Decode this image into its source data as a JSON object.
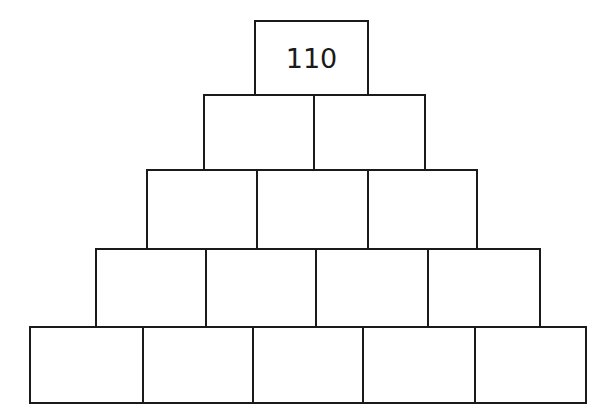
{
  "rows": [
    {
      "cells": [
        {
          "value": "110",
          "x": 254,
          "y": 20,
          "w": 115,
          "h": 76
        }
      ]
    },
    {
      "cells": [
        {
          "value": "",
          "x": 203,
          "y": 94,
          "w": 112,
          "h": 77
        },
        {
          "value": "",
          "x": 313,
          "y": 94,
          "w": 113,
          "h": 77
        }
      ]
    },
    {
      "cells": [
        {
          "value": "",
          "x": 146,
          "y": 169,
          "w": 112,
          "h": 81
        },
        {
          "value": "",
          "x": 256,
          "y": 169,
          "w": 113,
          "h": 81
        },
        {
          "value": "",
          "x": 367,
          "y": 169,
          "w": 111,
          "h": 81
        }
      ]
    },
    {
      "cells": [
        {
          "value": "",
          "x": 95,
          "y": 248,
          "w": 112,
          "h": 80
        },
        {
          "value": "",
          "x": 205,
          "y": 248,
          "w": 112,
          "h": 80
        },
        {
          "value": "",
          "x": 315,
          "y": 248,
          "w": 114,
          "h": 80
        },
        {
          "value": "",
          "x": 427,
          "y": 248,
          "w": 114,
          "h": 80
        }
      ]
    },
    {
      "cells": [
        {
          "value": "",
          "x": 29,
          "y": 326,
          "w": 115,
          "h": 78
        },
        {
          "value": "",
          "x": 142,
          "y": 326,
          "w": 112,
          "h": 78
        },
        {
          "value": "",
          "x": 252,
          "y": 326,
          "w": 112,
          "h": 78
        },
        {
          "value": "",
          "x": 362,
          "y": 326,
          "w": 114,
          "h": 78
        },
        {
          "value": "",
          "x": 474,
          "y": 326,
          "w": 113,
          "h": 78
        }
      ]
    }
  ]
}
